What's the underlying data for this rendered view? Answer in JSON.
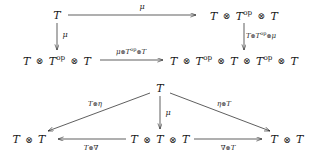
{
  "figure": {
    "kind": "commutative-diagram-pair",
    "background": "#ffffff",
    "ink": "#1a1a1a"
  },
  "diagrams": [
    {
      "id": "square",
      "name": "associativity-square",
      "nodes": [
        {
          "id": "tl",
          "text": "T",
          "x": 57,
          "y": 15
        },
        {
          "id": "tr",
          "text": "T ⊗ T^op ⊗ T",
          "x": 244,
          "y": 15
        },
        {
          "id": "bl",
          "text": "T ⊗ T^op ⊗ T",
          "x": 57,
          "y": 60
        },
        {
          "id": "br",
          "text": "T ⊗ T^op ⊗ T ⊗ T^op ⊗ T",
          "x": 234,
          "y": 60
        }
      ],
      "edges": [
        {
          "id": "top",
          "label": "μ",
          "lx": 142,
          "ly": 7
        },
        {
          "id": "left",
          "label": "μ",
          "lx": 65,
          "ly": 35
        },
        {
          "id": "right",
          "label": "T⊗T^op⊗μ",
          "lx": 261,
          "ly": 36
        },
        {
          "id": "bottom",
          "label": "μ⊗T^op⊗T",
          "lx": 131,
          "ly": 52
        }
      ]
    },
    {
      "id": "triangle",
      "name": "unit-triangle",
      "nodes": [
        {
          "id": "apex",
          "text": "T",
          "x": 160,
          "y": 88
        },
        {
          "id": "left",
          "text": "T ⊗ T",
          "x": 29,
          "y": 139
        },
        {
          "id": "center",
          "text": "T ⊗ T ⊗ T",
          "x": 160,
          "y": 139
        },
        {
          "id": "right",
          "text": "T ⊗ T",
          "x": 287,
          "y": 139
        }
      ],
      "edges": [
        {
          "id": "diag-left",
          "label": "T⊗η",
          "lx": 95,
          "ly": 104
        },
        {
          "id": "diag-right",
          "label": "η⊗T",
          "lx": 224,
          "ly": 104
        },
        {
          "id": "vertical",
          "label": "μ",
          "lx": 168,
          "ly": 113
        },
        {
          "id": "bottom-left",
          "label": "T⊗∇",
          "lx": 91,
          "ly": 148
        },
        {
          "id": "bottom-right",
          "label": "∇⊗T",
          "lx": 228,
          "ly": 148
        }
      ]
    }
  ]
}
